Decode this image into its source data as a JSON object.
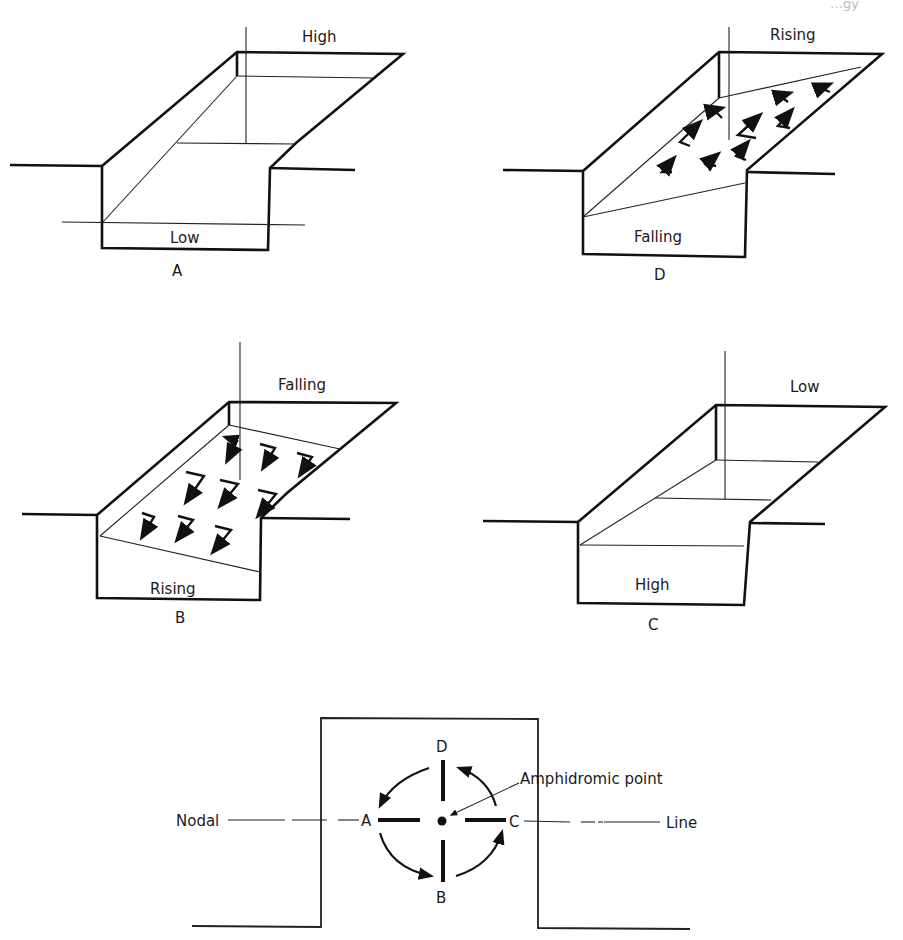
{
  "page_header_fragment": "…gy",
  "panels": [
    {
      "id": "A",
      "caption": "A",
      "far_end_label": "High",
      "near_end_label": "Low",
      "flow_arrows": "none"
    },
    {
      "id": "D",
      "caption": "D",
      "far_end_label": "Rising",
      "near_end_label": "Falling",
      "flow_arrows": "toward far end (up-left)"
    },
    {
      "id": "B",
      "caption": "B",
      "far_end_label": "Falling",
      "near_end_label": "Rising",
      "flow_arrows": "toward near end (down-left)"
    },
    {
      "id": "C",
      "caption": "C",
      "far_end_label": "Low",
      "near_end_label": "High",
      "flow_arrows": "none"
    }
  ],
  "amphidromic": {
    "points": {
      "top": "D",
      "left": "A",
      "right": "C",
      "bottom": "B"
    },
    "left_label": "Nodal",
    "right_label": "Line",
    "pointer_label": "Amphidromic point",
    "rotation": "counterclockwise D → A → B → C"
  },
  "colors": {
    "ink": "#111111",
    "background": "#ffffff"
  }
}
